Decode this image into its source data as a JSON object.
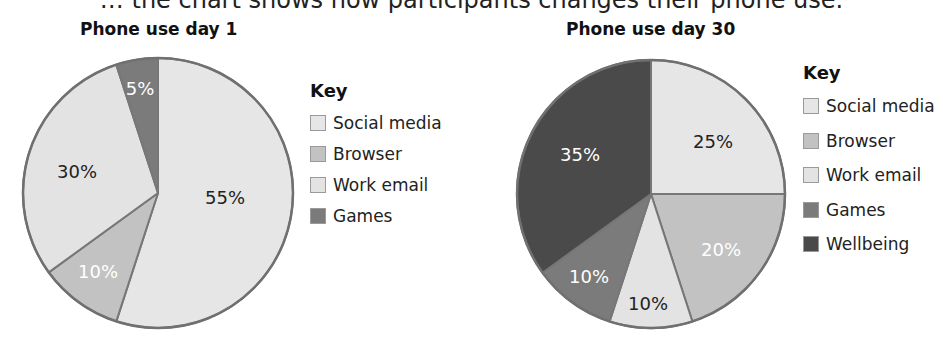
{
  "caption": "… the chart shows how participants changes their phone use.",
  "charts": [
    {
      "title": "Phone use day 1",
      "legend_title": "Key",
      "legend": [
        {
          "label": "Social media",
          "color": "#e6e6e6"
        },
        {
          "label": "Browser",
          "color": "#c2c2c2"
        },
        {
          "label": "Work email",
          "color": "#e3e3e3"
        },
        {
          "label": "Games",
          "color": "#7b7b7b"
        }
      ]
    },
    {
      "title": "Phone use day 30",
      "legend_title": "Key",
      "legend": [
        {
          "label": "Social media",
          "color": "#e6e6e6"
        },
        {
          "label": "Browser",
          "color": "#c2c2c2"
        },
        {
          "label": "Work email",
          "color": "#e3e3e3"
        },
        {
          "label": "Games",
          "color": "#7b7b7b"
        },
        {
          "label": "Wellbeing",
          "color": "#4a4a4a"
        }
      ]
    }
  ],
  "chart_data": [
    {
      "type": "pie",
      "title": "Phone use day 1",
      "legend_title": "Key",
      "legend_position": "right",
      "start_angle_deg": 0,
      "direction": "clockwise",
      "categories": [
        "Social media",
        "Browser",
        "Work email",
        "Games"
      ],
      "values": [
        55,
        10,
        30,
        5
      ],
      "labels": [
        "55%",
        "10%",
        "30%",
        "5%"
      ],
      "colors": [
        "#e6e6e6",
        "#c2c2c2",
        "#e3e3e3",
        "#7b7b7b"
      ],
      "label_colors": [
        "#222222",
        "#ffffff",
        "#222222",
        "#ffffff"
      ],
      "label_positions": [
        [
          225,
          198
        ],
        [
          98,
          272
        ],
        [
          77,
          172
        ],
        [
          140,
          89
        ]
      ],
      "center": [
        158,
        193
      ],
      "radius": 135
    },
    {
      "type": "pie",
      "title": "Phone use day 30",
      "legend_title": "Key",
      "legend_position": "right",
      "start_angle_deg": 0,
      "direction": "clockwise",
      "categories": [
        "Social media",
        "Browser",
        "Work email",
        "Games",
        "Wellbeing"
      ],
      "values": [
        25,
        20,
        10,
        10,
        35
      ],
      "labels": [
        "25%",
        "20%",
        "10%",
        "10%",
        "35%"
      ],
      "colors": [
        "#e6e6e6",
        "#c2c2c2",
        "#e3e3e3",
        "#7b7b7b",
        "#4a4a4a"
      ],
      "label_colors": [
        "#222222",
        "#ffffff",
        "#222222",
        "#ffffff",
        "#ffffff"
      ],
      "label_positions": [
        [
          713,
          142
        ],
        [
          721,
          250
        ],
        [
          648,
          304
        ],
        [
          589,
          277
        ],
        [
          580,
          155
        ]
      ],
      "center": [
        651,
        194
      ],
      "radius": 134
    }
  ]
}
